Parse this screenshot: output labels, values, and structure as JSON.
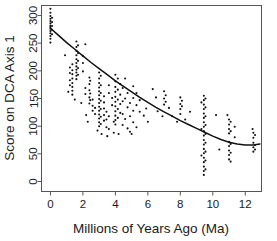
{
  "chart_data": {
    "type": "scatter",
    "title": "",
    "xlabel": "Millions of Years Ago (Ma)",
    "ylabel": "Score on DCA Axis 1",
    "xlim": [
      -0.55,
      13.0
    ],
    "ylim": [
      -18,
      318
    ],
    "xticks": [
      0,
      2,
      4,
      6,
      8,
      10,
      12
    ],
    "xtick_labels": [
      "0",
      "2",
      "4",
      "6",
      "8",
      "10",
      "12"
    ],
    "yticks": [
      0,
      50,
      100,
      150,
      200,
      250,
      300
    ],
    "ytick_labels": [
      "0",
      "50",
      "100",
      "150",
      "200",
      "250",
      "300"
    ],
    "grid": false,
    "legend": null,
    "marker": "small-dot",
    "point_color": "#111111",
    "curve_color": "#111111",
    "curve_label": "fitted quadratic trend",
    "fit_curve": {
      "type": "quadratic",
      "x": [
        0.0,
        0.5,
        1.0,
        1.5,
        2.0,
        2.5,
        3.0,
        3.5,
        4.0,
        4.5,
        5.0,
        5.5,
        6.0,
        6.5,
        7.0,
        7.5,
        8.0,
        8.5,
        9.0,
        9.5,
        10.0,
        10.5,
        11.0,
        11.5,
        12.0,
        12.5,
        12.9
      ],
      "y": [
        277,
        264,
        251,
        239,
        227,
        215,
        204,
        193,
        182,
        172,
        162,
        152,
        143,
        134,
        126,
        118,
        110,
        103,
        96,
        89,
        82,
        76,
        71,
        68,
        66,
        66,
        68
      ]
    },
    "points": [
      [
        0.0,
        312
      ],
      [
        0.0,
        305
      ],
      [
        0.0,
        299
      ],
      [
        0.0,
        294
      ],
      [
        0.0,
        290
      ],
      [
        0.0,
        286
      ],
      [
        0.0,
        282
      ],
      [
        0.0,
        279
      ],
      [
        0.0,
        276
      ],
      [
        0.0,
        272
      ],
      [
        0.0,
        268
      ],
      [
        0.0,
        263
      ],
      [
        0.0,
        258
      ],
      [
        0.0,
        251
      ],
      [
        0.1,
        296
      ],
      [
        0.1,
        288
      ],
      [
        0.1,
        281
      ],
      [
        0.1,
        274
      ],
      [
        0.1,
        266
      ],
      [
        1.6,
        253
      ],
      [
        1.6,
        243
      ],
      [
        1.6,
        236
      ],
      [
        1.6,
        228
      ],
      [
        1.6,
        221
      ],
      [
        1.6,
        214
      ],
      [
        1.6,
        208
      ],
      [
        1.6,
        202
      ],
      [
        1.6,
        197
      ],
      [
        1.6,
        191
      ],
      [
        1.6,
        185
      ],
      [
        1.7,
        246
      ],
      [
        1.7,
        232
      ],
      [
        1.7,
        218
      ],
      [
        1.7,
        205
      ],
      [
        1.7,
        193
      ],
      [
        1.35,
        212
      ],
      [
        1.35,
        201
      ],
      [
        1.35,
        194
      ],
      [
        1.35,
        186
      ],
      [
        1.35,
        178
      ],
      [
        1.35,
        171
      ],
      [
        1.35,
        164
      ],
      [
        1.35,
        157
      ],
      [
        1.2,
        206
      ],
      [
        1.2,
        196
      ],
      [
        1.2,
        183
      ],
      [
        1.2,
        174
      ],
      [
        2.0,
        227
      ],
      [
        2.0,
        214
      ],
      [
        2.0,
        199
      ],
      [
        2.15,
        248
      ],
      [
        2.15,
        169
      ],
      [
        2.15,
        158
      ],
      [
        2.4,
        188
      ],
      [
        2.4,
        176
      ],
      [
        2.4,
        165
      ],
      [
        2.4,
        152
      ],
      [
        2.4,
        141
      ],
      [
        2.45,
        182
      ],
      [
        2.45,
        159
      ],
      [
        2.45,
        147
      ],
      [
        2.6,
        148
      ],
      [
        2.6,
        137
      ],
      [
        2.6,
        128
      ],
      [
        2.75,
        133
      ],
      [
        2.75,
        122
      ],
      [
        3.0,
        197
      ],
      [
        3.0,
        186
      ],
      [
        3.0,
        178
      ],
      [
        3.0,
        170
      ],
      [
        3.0,
        163
      ],
      [
        3.0,
        156
      ],
      [
        3.0,
        149
      ],
      [
        3.0,
        142
      ],
      [
        3.0,
        135
      ],
      [
        3.0,
        128
      ],
      [
        3.0,
        121
      ],
      [
        3.0,
        114
      ],
      [
        3.0,
        107
      ],
      [
        3.0,
        100
      ],
      [
        3.1,
        191
      ],
      [
        3.1,
        174
      ],
      [
        3.1,
        160
      ],
      [
        3.1,
        146
      ],
      [
        3.1,
        131
      ],
      [
        3.1,
        117
      ],
      [
        3.1,
        104
      ],
      [
        3.3,
        154
      ],
      [
        3.3,
        143
      ],
      [
        3.3,
        132
      ],
      [
        3.3,
        120
      ],
      [
        3.3,
        110
      ],
      [
        3.45,
        126
      ],
      [
        3.45,
        112
      ],
      [
        3.45,
        98
      ],
      [
        3.6,
        174
      ],
      [
        3.6,
        160
      ],
      [
        3.6,
        118
      ],
      [
        3.6,
        95
      ],
      [
        3.8,
        151
      ],
      [
        3.8,
        138
      ],
      [
        3.9,
        108
      ],
      [
        3.9,
        88
      ],
      [
        2.9,
        92
      ],
      [
        3.15,
        86
      ],
      [
        4.0,
        193
      ],
      [
        4.0,
        181
      ],
      [
        4.0,
        171
      ],
      [
        4.0,
        162
      ],
      [
        4.0,
        153
      ],
      [
        4.0,
        144
      ],
      [
        4.0,
        136
      ],
      [
        4.0,
        127
      ],
      [
        4.0,
        119
      ],
      [
        4.0,
        111
      ],
      [
        4.0,
        103
      ],
      [
        4.15,
        186
      ],
      [
        4.15,
        166
      ],
      [
        4.15,
        148
      ],
      [
        4.15,
        131
      ],
      [
        4.15,
        115
      ],
      [
        4.3,
        176
      ],
      [
        4.3,
        157
      ],
      [
        4.3,
        140
      ],
      [
        4.3,
        124
      ],
      [
        4.45,
        169
      ],
      [
        4.45,
        145
      ],
      [
        4.45,
        122
      ],
      [
        4.45,
        102
      ],
      [
        4.6,
        186
      ],
      [
        4.6,
        150
      ],
      [
        4.6,
        113
      ],
      [
        4.75,
        160
      ],
      [
        4.75,
        134
      ],
      [
        4.75,
        96
      ],
      [
        4.9,
        142
      ],
      [
        4.9,
        118
      ],
      [
        4.9,
        90
      ],
      [
        5.1,
        172
      ],
      [
        5.1,
        151
      ],
      [
        5.1,
        128
      ],
      [
        5.1,
        107
      ],
      [
        5.3,
        160
      ],
      [
        5.3,
        138
      ],
      [
        5.3,
        98
      ],
      [
        5.5,
        147
      ],
      [
        5.5,
        126
      ],
      [
        5.75,
        119
      ],
      [
        5.9,
        132
      ],
      [
        6.3,
        167
      ],
      [
        6.5,
        152
      ],
      [
        6.6,
        127
      ],
      [
        7.0,
        163
      ],
      [
        7.0,
        150
      ],
      [
        7.0,
        139
      ],
      [
        7.1,
        156
      ],
      [
        7.1,
        144
      ],
      [
        7.3,
        133
      ],
      [
        7.5,
        118
      ],
      [
        8.0,
        152
      ],
      [
        8.0,
        140
      ],
      [
        8.0,
        131
      ],
      [
        8.0,
        122
      ],
      [
        8.1,
        146
      ],
      [
        8.1,
        136
      ],
      [
        8.3,
        112
      ],
      [
        8.6,
        126
      ],
      [
        9.45,
        155
      ],
      [
        9.45,
        147
      ],
      [
        9.45,
        139
      ],
      [
        9.45,
        131
      ],
      [
        9.45,
        123
      ],
      [
        9.45,
        115
      ],
      [
        9.45,
        107
      ],
      [
        9.45,
        99
      ],
      [
        9.45,
        91
      ],
      [
        9.45,
        83
      ],
      [
        9.45,
        75
      ],
      [
        9.45,
        67
      ],
      [
        9.45,
        59
      ],
      [
        9.45,
        51
      ],
      [
        9.45,
        43
      ],
      [
        9.45,
        35
      ],
      [
        9.45,
        27
      ],
      [
        9.45,
        19
      ],
      [
        9.45,
        12
      ],
      [
        9.55,
        150
      ],
      [
        9.55,
        134
      ],
      [
        9.55,
        118
      ],
      [
        9.55,
        102
      ],
      [
        9.55,
        86
      ],
      [
        9.55,
        70
      ],
      [
        9.55,
        54
      ],
      [
        9.55,
        38
      ],
      [
        9.55,
        22
      ],
      [
        9.3,
        143
      ],
      [
        9.3,
        95
      ],
      [
        9.3,
        47
      ],
      [
        10.2,
        120
      ],
      [
        10.4,
        58
      ],
      [
        11.0,
        112
      ],
      [
        11.0,
        103
      ],
      [
        11.0,
        95
      ],
      [
        11.0,
        87
      ],
      [
        11.0,
        72
      ],
      [
        11.0,
        64
      ],
      [
        11.0,
        56
      ],
      [
        11.0,
        48
      ],
      [
        11.0,
        40
      ],
      [
        11.1,
        108
      ],
      [
        11.1,
        91
      ],
      [
        11.1,
        68
      ],
      [
        11.1,
        52
      ],
      [
        11.1,
        36
      ],
      [
        11.35,
        99
      ],
      [
        11.35,
        80
      ],
      [
        12.5,
        88
      ],
      [
        12.5,
        79
      ],
      [
        12.5,
        70
      ],
      [
        12.5,
        62
      ],
      [
        12.5,
        54
      ],
      [
        12.6,
        84
      ],
      [
        12.6,
        66
      ],
      [
        12.6,
        58
      ],
      [
        6.0,
        108
      ],
      [
        5.0,
        86
      ],
      [
        2.2,
        120
      ],
      [
        1.9,
        142
      ],
      [
        2.3,
        108
      ],
      [
        1.5,
        148
      ],
      [
        1.1,
        162
      ],
      [
        0.9,
        228
      ],
      [
        6.9,
        118
      ],
      [
        7.8,
        108
      ],
      [
        3.5,
        82
      ],
      [
        4.2,
        86
      ],
      [
        10.9,
        120
      ],
      [
        12.45,
        95
      ]
    ]
  }
}
